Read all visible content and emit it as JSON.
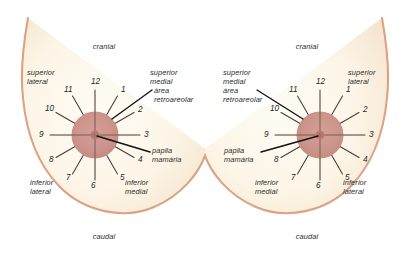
{
  "figure": {
    "title": "",
    "colors": {
      "outline": "#dba285",
      "breast_fill_light": "#fdf8ec",
      "breast_fill_warm": "#f6e7d2",
      "areola": "#ca9188",
      "nipple": "#b3766d",
      "spoke": "#4a3a37",
      "leader": "#1a1a1a",
      "text": "#2b2b2b"
    },
    "clock_numbers": [
      "1",
      "2",
      "3",
      "4",
      "5",
      "6",
      "7",
      "8",
      "9",
      "10",
      "11",
      "12"
    ]
  },
  "diagrams": [
    {
      "side": "left",
      "orientation": "lateral-left",
      "axis": {
        "top": "cranial",
        "bottom": "caudal"
      },
      "quadrants": {
        "upper_outer": {
          "line1": "superior",
          "line2": "lateral"
        },
        "upper_inner": {
          "line1": "superior",
          "line2": "medial"
        },
        "lower_outer": {
          "line1": "inferior",
          "line2": "lateral"
        },
        "lower_inner": {
          "line1": "inferior",
          "line2": "medial"
        }
      },
      "callouts": [
        {
          "name": "retroareolar-area",
          "line1": "área",
          "line2": "retroareolar"
        },
        {
          "name": "nipple",
          "line1": "papila",
          "line2": "mamária"
        }
      ]
    },
    {
      "side": "right",
      "orientation": "lateral-right",
      "axis": {
        "top": "cranial",
        "bottom": "caudal"
      },
      "quadrants": {
        "upper_outer": {
          "line1": "superior",
          "line2": "lateral"
        },
        "upper_inner": {
          "line1": "superior",
          "line2": "medial"
        },
        "lower_outer": {
          "line1": "inferior",
          "line2": "lateral"
        },
        "lower_inner": {
          "line1": "inferior",
          "line2": "medial"
        }
      },
      "callouts": [
        {
          "name": "retroareolar-area",
          "line1": "área",
          "line2": "retroareolar"
        },
        {
          "name": "nipple",
          "line1": "papila",
          "line2": "mamária"
        }
      ]
    }
  ]
}
